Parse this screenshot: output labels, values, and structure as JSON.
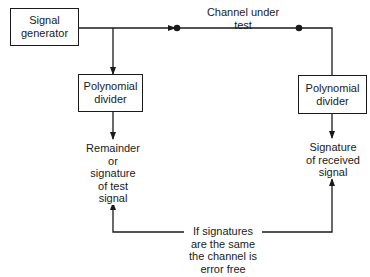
{
  "diagram": {
    "nodes": {
      "signal_generator": {
        "line1": "Signal",
        "line2": "generator"
      },
      "divider_left": {
        "line1": "Polynomial",
        "line2": "divider"
      },
      "divider_right": {
        "line1": "Polynomial",
        "line2": "divider"
      }
    },
    "labels": {
      "channel": {
        "line1": "Channel under",
        "line2": "test"
      },
      "remainder": {
        "lines": [
          "Remainder",
          "or",
          "signature",
          "of test",
          "signal"
        ]
      },
      "received": {
        "lines": [
          "Signature",
          "of received",
          "signal"
        ]
      },
      "comparison": {
        "lines": [
          "If signatures",
          "are the same",
          "the channel is",
          "error free"
        ]
      }
    },
    "edges": [
      {
        "from": "signal_generator",
        "to": "channel_under_test"
      },
      {
        "from": "signal_generator",
        "to": "divider_left"
      },
      {
        "from": "channel_under_test",
        "to": "divider_right"
      },
      {
        "from": "divider_left",
        "to": "remainder"
      },
      {
        "from": "divider_right",
        "to": "received"
      },
      {
        "from": "comparison",
        "to": "remainder"
      },
      {
        "from": "comparison",
        "to": "received"
      }
    ],
    "colors": {
      "line": "#1a1a1a",
      "background": "#ffffff"
    }
  }
}
